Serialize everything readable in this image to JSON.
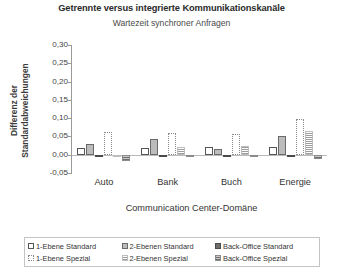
{
  "chart_data": {
    "type": "bar",
    "title": "Getrennte versus integrierte Kommunikationskanäle",
    "subtitle": "Wartezeit synchroner Anfragen",
    "xlabel": "Communication Center-Domäne",
    "ylabel": "Differenz der Standardabweichungen",
    "categories": [
      "Auto",
      "Bank",
      "Buch",
      "Energie"
    ],
    "ylim": [
      -0.05,
      0.3
    ],
    "ytick_labels": [
      "0,30",
      "0,25",
      "0,20",
      "0,15",
      "0,10",
      "0,05",
      "0,00",
      "-0,05"
    ],
    "ytick_values": [
      0.3,
      0.25,
      0.2,
      0.15,
      0.1,
      0.05,
      0.0,
      -0.05
    ],
    "grid": false,
    "legend_position": "bottom",
    "series": [
      {
        "name": "1-Ebene Standard",
        "values": [
          0.018,
          0.017,
          0.02,
          0.022
        ]
      },
      {
        "name": "2-Ebenen Standard",
        "values": [
          0.03,
          0.043,
          0.016,
          0.05
        ]
      },
      {
        "name": "Back-Office Standard",
        "values": [
          0.0,
          -0.002,
          -0.003,
          -0.003
        ]
      },
      {
        "name": "1-Ebene Spezial",
        "values": [
          0.062,
          0.06,
          0.057,
          0.098
        ]
      },
      {
        "name": "2-Ebenen Spezial",
        "values": [
          -0.002,
          0.022,
          0.025,
          0.066
        ]
      },
      {
        "name": "Back-Office Spezial",
        "values": [
          -0.016,
          -0.002,
          -0.005,
          -0.012
        ]
      }
    ]
  },
  "legend": {
    "items": [
      "1-Ebene Standard",
      "2-Ebenen Standard",
      "Back-Office Standard",
      "1-Ebene Spezial",
      "2-Ebenen Spezial",
      "Back-Office Spezial"
    ]
  }
}
